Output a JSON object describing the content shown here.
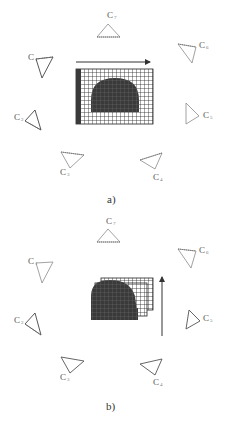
{
  "figure": {
    "panels": [
      {
        "id": "a",
        "caption": "a)",
        "motion": "horizontal-right",
        "cameras": [
          {
            "name": "C",
            "sub": "7",
            "label_pos": "top"
          },
          {
            "name": "C",
            "sub": "6",
            "label_pos": "top-right"
          },
          {
            "name": "C",
            "sub": "5",
            "label_pos": "right"
          },
          {
            "name": "C",
            "sub": "4",
            "label_pos": "bottom-right"
          },
          {
            "name": "C",
            "sub": "3",
            "label_pos": "bottom-left"
          },
          {
            "name": "C",
            "sub": "2",
            "label_pos": "left"
          },
          {
            "name": "C",
            "sub": "1",
            "label_pos": "top-left"
          }
        ]
      },
      {
        "id": "b",
        "caption": "b)",
        "motion": "vertical-up",
        "cameras": [
          {
            "name": "C",
            "sub": "7",
            "label_pos": "top"
          },
          {
            "name": "C",
            "sub": "6",
            "label_pos": "top-right"
          },
          {
            "name": "C",
            "sub": "5",
            "label_pos": "right"
          },
          {
            "name": "C",
            "sub": "4",
            "label_pos": "bottom-right"
          },
          {
            "name": "C",
            "sub": "3",
            "label_pos": "bottom-left"
          },
          {
            "name": "C",
            "sub": "2",
            "label_pos": "left"
          },
          {
            "name": "C",
            "sub": "1",
            "label_pos": "top-left"
          }
        ]
      }
    ],
    "colors": {
      "grid_line": "#222222",
      "shape_fill": "#3a3a3a",
      "camera_stroke": "#8a8a8a",
      "camera_stroke_dark": "#444444",
      "arrow": "#333333"
    }
  }
}
